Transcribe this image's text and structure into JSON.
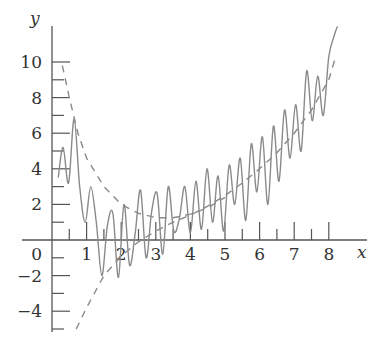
{
  "chart_data": {
    "type": "line",
    "title": "",
    "xlabel": "x",
    "ylabel": "y",
    "xlim": [
      0,
      8.5
    ],
    "ylim": [
      -5.5,
      11
    ],
    "grid": false,
    "x_ticks": [
      "0",
      "1",
      "2",
      "3",
      "4",
      "5",
      "6",
      "7",
      "8"
    ],
    "y_ticks": [
      "10",
      "8",
      "6",
      "4",
      "2",
      "-2",
      "-4"
    ],
    "series": [
      {
        "name": "upper dashed curve",
        "style": "dashed",
        "x": [
          0.3,
          0.5,
          0.75,
          1.0,
          1.5,
          2.0,
          2.5,
          3.0,
          3.5,
          4.0,
          4.5,
          5.0
        ],
        "values": [
          9.8,
          8.0,
          6.0,
          4.6,
          3.0,
          2.0,
          1.5,
          1.25,
          1.25,
          1.45,
          1.8,
          2.4
        ]
      },
      {
        "name": "lower dashed curve",
        "style": "dashed",
        "x": [
          0.7,
          1.0,
          1.5,
          2.0,
          2.5,
          3.0,
          3.5,
          4.0,
          4.5,
          5.0,
          5.5,
          6.0,
          6.5,
          7.0,
          7.5,
          8.0,
          8.2
        ],
        "values": [
          -5.0,
          -3.8,
          -2.0,
          -0.9,
          -0.1,
          0.5,
          1.0,
          1.4,
          1.9,
          2.5,
          3.2,
          4.0,
          4.9,
          6.0,
          7.3,
          9.0,
          10.3
        ]
      },
      {
        "name": "oscillating solid curve",
        "style": "solid",
        "x": [
          0.18,
          0.32,
          0.48,
          0.64,
          0.8,
          0.96,
          1.12,
          1.28,
          1.44,
          1.6,
          1.76,
          1.92,
          2.08,
          2.24,
          2.4,
          2.56,
          2.72,
          2.88,
          3.04,
          3.2,
          3.36,
          3.52,
          3.68,
          3.84,
          4.0,
          4.16,
          4.32,
          4.48,
          4.64,
          4.8,
          4.96,
          5.12,
          5.28,
          5.44,
          5.6,
          5.76,
          5.92,
          6.08,
          6.24,
          6.4,
          6.56,
          6.72,
          6.88,
          7.04,
          7.2,
          7.36,
          7.52,
          7.68,
          7.84,
          8.0,
          8.16,
          8.25
        ],
        "values": [
          3.5,
          5.2,
          3.2,
          6.8,
          3.0,
          1.0,
          3.0,
          1.0,
          -2.0,
          0.8,
          1.5,
          -2.1,
          2.0,
          -1.4,
          0.3,
          2.8,
          -1.0,
          1.6,
          2.6,
          -0.8,
          3.0,
          0.5,
          1.2,
          3.0,
          0.4,
          3.3,
          0.6,
          4.0,
          1.0,
          3.6,
          0.5,
          4.2,
          2.0,
          4.6,
          1.1,
          5.4,
          2.7,
          5.8,
          2.0,
          6.4,
          3.3,
          7.3,
          4.6,
          7.6,
          5.0,
          9.5,
          6.7,
          9.2,
          7.0,
          10.3,
          11.5,
          12.0
        ]
      }
    ],
    "layout": {
      "origin_px": [
        52,
        240
      ],
      "x_unit_px": 34.6,
      "y_unit_px": 17.8
    }
  },
  "labels": {
    "x_axis": "x",
    "y_axis": "y",
    "origin": "0"
  }
}
